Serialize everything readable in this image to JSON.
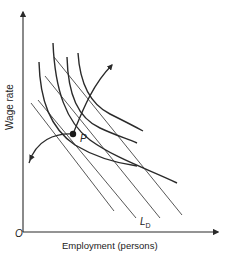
{
  "figure": {
    "y_axis_label": "Wage rate",
    "x_axis_label": "Employment  (persons)",
    "origin_label": "O",
    "point_label": "P",
    "demand_label_main": "L",
    "demand_label_sub": "D"
  },
  "colors": {
    "ink": "#2a2a2a",
    "thin_line": "#444444",
    "background": "#ffffff"
  }
}
